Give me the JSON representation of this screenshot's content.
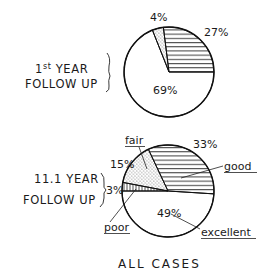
{
  "chart_data": [
    {
      "type": "pie",
      "title": "1st YEAR FOLLOW UP",
      "title_lines": [
        "1st YEAR",
        "FOLLOW UP"
      ],
      "slices": [
        {
          "label": "excellent",
          "value": 69,
          "display": "69%",
          "pattern": "blank"
        },
        {
          "label": "fair",
          "value": 4,
          "display": "4%",
          "pattern": "dotted"
        },
        {
          "label": "good",
          "value": 27,
          "display": "27%",
          "pattern": "hatched"
        }
      ]
    },
    {
      "type": "pie",
      "title": "11.1 YEAR FOLLOW UP",
      "title_lines": [
        "11.1 YEAR",
        "FOLLOW UP"
      ],
      "slices": [
        {
          "label": "excellent",
          "value": 49,
          "display": "49%",
          "pattern": "blank"
        },
        {
          "label": "poor",
          "value": 3,
          "display": "3%",
          "pattern": "hatched-vertical"
        },
        {
          "label": "fair",
          "value": 15,
          "display": "15%",
          "pattern": "dotted"
        },
        {
          "label": "good",
          "value": 33,
          "display": "33%",
          "pattern": "hatched"
        }
      ],
      "category_labels": [
        "fair",
        "good",
        "poor",
        "excellent"
      ]
    }
  ],
  "caption": "ALL CASES",
  "labels": {
    "top_title_1_base": "1",
    "top_title_1_sup": "st",
    "top_title_1_rest": " YEAR",
    "top_title_2": "FOLLOW UP",
    "bot_title_1": "11.1 YEAR",
    "bot_title_2": "FOLLOW UP",
    "top_pct_fair": "4%",
    "top_pct_good": "27%",
    "top_pct_excellent": "69%",
    "bot_pct_fair": "15%",
    "bot_pct_good": "33%",
    "bot_pct_poor": "3%",
    "bot_pct_excellent": "49%",
    "cat_fair": "fair",
    "cat_good": "good",
    "cat_poor": "poor",
    "cat_excellent": "excellent"
  }
}
